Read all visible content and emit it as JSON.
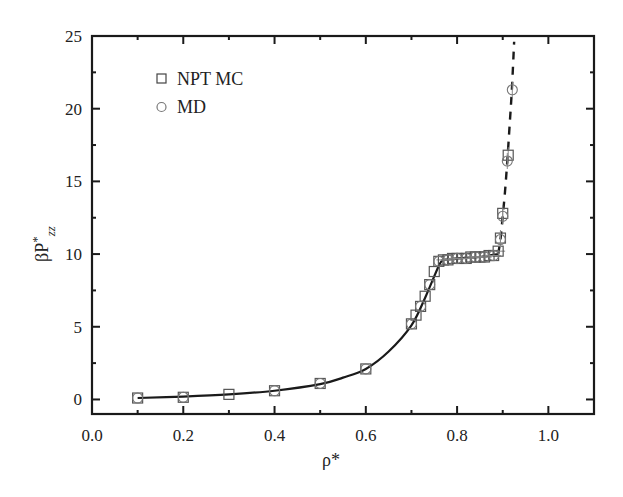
{
  "chart_data": {
    "type": "scatter",
    "title": "",
    "xlabel": "ρ*",
    "ylabel": "βP*zz",
    "ylabel_main": "βP",
    "ylabel_sup": "*",
    "ylabel_sub": "zz",
    "xlim": [
      0.0,
      1.1
    ],
    "ylim": [
      -1,
      25
    ],
    "x_ticks": [
      0.0,
      0.2,
      0.4,
      0.6,
      0.8,
      1.0
    ],
    "x_tick_labels": [
      "0.0",
      "0.2",
      "0.4",
      "0.6",
      "0.8",
      "1.0"
    ],
    "y_ticks": [
      0,
      5,
      10,
      15,
      20,
      25
    ],
    "y_tick_labels": [
      "0",
      "5",
      "10",
      "15",
      "20",
      "25"
    ],
    "grid": false,
    "legend_position": "upper left",
    "legend": [
      {
        "label": "NPT MC",
        "marker": "square"
      },
      {
        "label": "MD",
        "marker": "circle"
      }
    ],
    "series": [
      {
        "name": "NPT MC",
        "marker": "square",
        "x": [
          0.1,
          0.2,
          0.3,
          0.4,
          0.5,
          0.6,
          0.7,
          0.71,
          0.72,
          0.73,
          0.74,
          0.75,
          0.76,
          0.77,
          0.78,
          0.79,
          0.8,
          0.81,
          0.82,
          0.83,
          0.84,
          0.85,
          0.86,
          0.87,
          0.88,
          0.89,
          0.895,
          0.9,
          0.912
        ],
        "y": [
          0.1,
          0.15,
          0.35,
          0.6,
          1.1,
          2.1,
          5.2,
          5.8,
          6.4,
          7.1,
          7.9,
          8.8,
          9.5,
          9.6,
          9.6,
          9.7,
          9.7,
          9.7,
          9.7,
          9.8,
          9.8,
          9.8,
          9.8,
          9.9,
          9.9,
          10.2,
          11.1,
          12.8,
          16.8
        ]
      },
      {
        "name": "MD",
        "marker": "circle",
        "x": [
          0.1,
          0.2,
          0.4,
          0.5,
          0.6,
          0.7,
          0.72,
          0.74,
          0.76,
          0.78,
          0.8,
          0.82,
          0.84,
          0.86,
          0.88,
          0.895,
          0.9,
          0.91,
          0.921
        ],
        "y": [
          0.1,
          0.15,
          0.6,
          1.1,
          2.1,
          5.2,
          6.4,
          7.9,
          9.5,
          9.6,
          9.7,
          9.7,
          9.8,
          9.8,
          9.9,
          11.0,
          12.6,
          16.4,
          21.3
        ]
      }
    ],
    "fit_curves": [
      {
        "name": "solid fit (fluid branch)",
        "style": "solid",
        "x": [
          0.1,
          0.2,
          0.3,
          0.4,
          0.5,
          0.55,
          0.6,
          0.65,
          0.7,
          0.73,
          0.76,
          0.77
        ],
        "y": [
          0.1,
          0.2,
          0.35,
          0.6,
          1.05,
          1.5,
          2.1,
          3.3,
          5.1,
          7.0,
          9.2,
          9.6
        ]
      },
      {
        "name": "plateau",
        "style": "solid",
        "x": [
          0.77,
          0.8,
          0.85,
          0.89
        ],
        "y": [
          9.6,
          9.7,
          9.8,
          10.0
        ]
      },
      {
        "name": "dashed fit (dense branch)",
        "style": "dashed",
        "x": [
          0.89,
          0.895,
          0.9,
          0.905,
          0.91,
          0.915,
          0.92,
          0.925
        ],
        "y": [
          10.0,
          11.0,
          12.6,
          14.3,
          16.4,
          18.8,
          21.3,
          24.6
        ]
      }
    ]
  },
  "colors": {
    "axis": "#1a1a1a",
    "line": "#1a1a1a",
    "marker": "#555555",
    "circle_marker": "#777777"
  }
}
